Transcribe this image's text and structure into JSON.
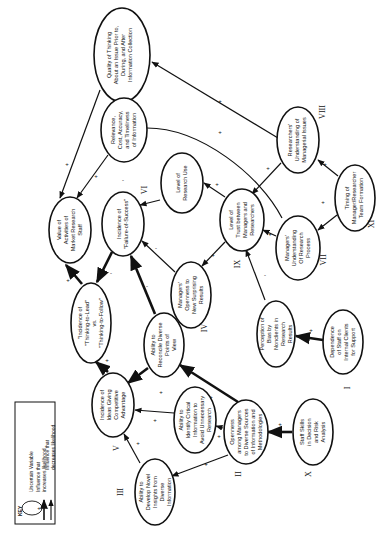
{
  "nodes": {
    "quality_thinking": {
      "lines": [
        "Quality of Thinking",
        "About an Issue Prior to,",
        "During, and After",
        "Information Collection"
      ]
    },
    "relevance": {
      "lines": [
        "Relevance,",
        "Cost, Accuracy,",
        "and Timeliness",
        "of Information"
      ]
    },
    "research_use": {
      "lines": [
        "Level of",
        "Research Use"
      ]
    },
    "value_activities": {
      "lines": [
        "Value of",
        "Activities of",
        "Market Research",
        "Staff"
      ]
    },
    "failure_success": {
      "lines": [
        "Incidence of",
        "\"Failure-of-Success\""
      ],
      "roman": "VI"
    },
    "researchers_understanding": {
      "lines": [
        "Researchers'",
        "Understanding of",
        "Managerial Issues"
      ],
      "roman": "VIII"
    },
    "timing": {
      "lines": [
        "Timing of",
        "Manager/Researcher",
        "Team Formation"
      ],
      "roman": "XI"
    },
    "trust": {
      "lines": [
        "Level of",
        "Trust between",
        "Managers and",
        "Researchers"
      ],
      "roman": "IX"
    },
    "managers_understanding": {
      "lines": [
        "Managers'",
        "Understanding",
        "Of Research",
        "Process"
      ],
      "roman": "VII"
    },
    "managers_openness": {
      "lines": [
        "Managers'",
        "Openness to",
        "New Surprising",
        "Results"
      ]
    },
    "perception_bias": {
      "lines": [
        "Perception of",
        "Bias by",
        "Nonclients in",
        "Research",
        "Results"
      ]
    },
    "dependence": {
      "lines": [
        "Dependence",
        "of Staff on",
        "Internal Clients",
        "for Support"
      ],
      "roman": "I"
    },
    "thinking_lead": {
      "lines": [
        "\"Incidence of",
        "\"Thinking-to-Lead\"",
        "vs.",
        "\"Thinking-to-Follow\""
      ]
    },
    "reconcile": {
      "lines": [
        "Ability to",
        "Reconcile Diverse",
        "Points of",
        "View"
      ],
      "roman": "IV"
    },
    "ideas_advantage": {
      "lines": [
        "Incidence of",
        "Ideas Giving",
        "Competitive",
        "Advantage"
      ],
      "roman": "V"
    },
    "identify_critical": {
      "lines": [
        "Ability to",
        "Identify Critical",
        "Information to",
        "Avoid Unnecessary",
        "Research"
      ]
    },
    "openness_sources": {
      "lines": [
        "Openness",
        "among Managers",
        "to Diverse Sources",
        "of Information and",
        "Methodologies"
      ],
      "roman": "II"
    },
    "staff_skills": {
      "lines": [
        "Staff Skills",
        "in Decision",
        "and Risk",
        "Analysis"
      ],
      "roman": "X"
    },
    "novel_insights": {
      "lines": [
        "Ability to",
        "Develop Novel",
        "Insights from",
        "Diverse",
        "Information"
      ],
      "roman": "III"
    }
  },
  "key": {
    "title": "KEY",
    "uncertain": "Uncertain Variable",
    "plus_sign": "+",
    "minus_sign": "-",
    "increase": [
      "Influence that",
      "increases likelihood"
    ],
    "decrease": [
      "Influence that",
      "decreases likelihood"
    ]
  },
  "signs": {
    "plus": "+",
    "minus": "-"
  }
}
